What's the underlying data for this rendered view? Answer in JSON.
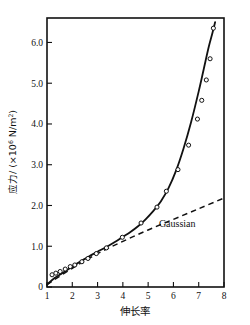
{
  "chart_data": {
    "type": "line",
    "title": "",
    "xlabel": "伸长率",
    "ylabel": "应力/ (×10⁶ N/m²)",
    "ylabel_parts": {
      "text": "应力/ (×10",
      "exponent": "6",
      "tail": " N/m",
      "tail_exponent": "2",
      "close": ")"
    },
    "xlim": [
      1,
      8
    ],
    "ylim": [
      0,
      6.6
    ],
    "xticks": [
      1,
      2,
      3,
      4,
      5,
      6,
      7,
      8
    ],
    "xticklabels": [
      "1",
      "2",
      "3",
      "4",
      "5",
      "6",
      "7",
      "8"
    ],
    "yticks": [
      0,
      1.0,
      2.0,
      3.0,
      4.0,
      5.0,
      6.0
    ],
    "yticklabels": [
      "0",
      "1.0",
      "2.0",
      "3.0",
      "4.0",
      "5.0",
      "6.0"
    ],
    "grid": false,
    "legend_position": "inline-annotation",
    "series": [
      {
        "name": "experimental",
        "style": "markers",
        "marker": "open-circle",
        "x": [
          1.2,
          1.35,
          1.52,
          1.72,
          1.92,
          2.1,
          2.38,
          2.62,
          2.95,
          3.35,
          3.98,
          4.72,
          5.35,
          5.72,
          6.18,
          6.6,
          6.95,
          7.12,
          7.3,
          7.45,
          7.58
        ],
        "y": [
          0.3,
          0.34,
          0.38,
          0.44,
          0.5,
          0.54,
          0.62,
          0.7,
          0.82,
          0.96,
          1.22,
          1.57,
          1.96,
          2.35,
          2.88,
          3.48,
          4.12,
          4.58,
          5.08,
          5.6,
          6.35
        ]
      },
      {
        "name": "fitted curve",
        "style": "solid-line",
        "x": [
          1.0,
          1.3,
          1.6,
          1.9,
          2.2,
          2.5,
          2.8,
          3.1,
          3.4,
          3.7,
          4.0,
          4.3,
          4.6,
          4.9,
          5.2,
          5.5,
          5.8,
          6.1,
          6.4,
          6.7,
          7.0,
          7.2,
          7.4,
          7.55,
          7.65
        ],
        "y": [
          0.06,
          0.22,
          0.34,
          0.46,
          0.58,
          0.69,
          0.8,
          0.9,
          1.0,
          1.11,
          1.23,
          1.35,
          1.49,
          1.66,
          1.86,
          2.1,
          2.42,
          2.85,
          3.4,
          4.05,
          4.8,
          5.35,
          5.9,
          6.25,
          6.5
        ]
      },
      {
        "name": "Gaussian",
        "style": "dashed-line",
        "x": [
          1.0,
          2.0,
          3.0,
          4.0,
          5.0,
          6.0,
          7.0,
          7.95
        ],
        "y": [
          0.06,
          0.46,
          0.82,
          1.12,
          1.4,
          1.66,
          1.92,
          2.17
        ]
      }
    ],
    "annotations": [
      {
        "text": "Gaussian",
        "x": 6.15,
        "y": 1.46
      }
    ]
  },
  "figure": {
    "gaussian_label": "Gaussian"
  }
}
